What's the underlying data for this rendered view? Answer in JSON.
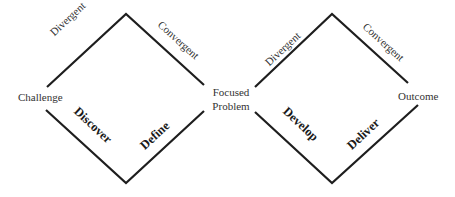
{
  "diagram": {
    "line_color": "#1e1e1e",
    "nodes": {
      "start": "Challenge",
      "middle_line1": "Focused",
      "middle_line2": "Problem",
      "end": "Outcome"
    },
    "diamonds": [
      {
        "top_left_label": "Divergent",
        "top_right_label": "Convergent",
        "bottom_left_phase": "Discover",
        "bottom_right_phase": "Define"
      },
      {
        "top_left_label": "Divergent",
        "top_right_label": "Convergent",
        "bottom_left_phase": "Develop",
        "bottom_right_phase": "Deliver"
      }
    ]
  }
}
